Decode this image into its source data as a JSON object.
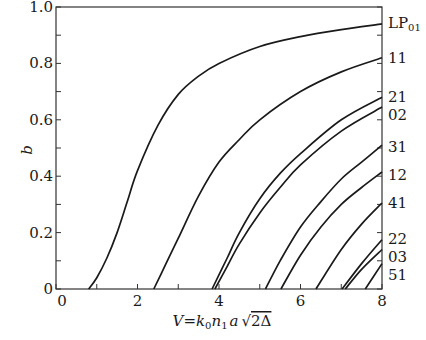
{
  "chart_data": {
    "type": "line",
    "title": "",
    "xlabel": "V = k0 n1 a √(2Δ)",
    "ylabel": "b",
    "xlim": [
      0,
      8
    ],
    "ylim": [
      0,
      1.0
    ],
    "grid": false,
    "legend_position": "right-edge inline labels",
    "x_ticks": [
      0,
      2,
      4,
      6,
      8
    ],
    "x_minor_ticks": [
      1,
      3,
      5,
      7
    ],
    "y_ticks": [
      0,
      0.2,
      0.4,
      0.6,
      0.8,
      1.0
    ],
    "y_tick_labels": [
      "0",
      "0.2",
      "0.4",
      "0.6",
      "0.8",
      "1.0"
    ],
    "y_minor_ticks": [
      0.1,
      0.3,
      0.5,
      0.7,
      0.9
    ],
    "series": [
      {
        "name": "LP01",
        "label": "LP",
        "label_sub": "01",
        "points": [
          [
            0.8,
            0
          ],
          [
            1.0,
            0.04
          ],
          [
            1.25,
            0.11
          ],
          [
            1.5,
            0.2
          ],
          [
            1.75,
            0.31
          ],
          [
            2,
            0.42
          ],
          [
            2.5,
            0.58
          ],
          [
            3,
            0.69
          ],
          [
            3.5,
            0.755
          ],
          [
            4,
            0.8
          ],
          [
            5,
            0.86
          ],
          [
            6,
            0.895
          ],
          [
            7,
            0.92
          ],
          [
            8,
            0.94
          ]
        ]
      },
      {
        "name": "11",
        "label": "11",
        "points": [
          [
            2.4,
            0
          ],
          [
            2.7,
            0.09
          ],
          [
            3,
            0.18
          ],
          [
            3.5,
            0.33
          ],
          [
            4,
            0.45
          ],
          [
            4.5,
            0.53
          ],
          [
            5,
            0.6
          ],
          [
            6,
            0.7
          ],
          [
            7,
            0.77
          ],
          [
            8,
            0.82
          ]
        ]
      },
      {
        "name": "21",
        "label": "21",
        "points": [
          [
            3.83,
            0
          ],
          [
            4.2,
            0.11
          ],
          [
            4.5,
            0.2
          ],
          [
            5,
            0.32
          ],
          [
            5.5,
            0.41
          ],
          [
            6,
            0.48
          ],
          [
            7,
            0.6
          ],
          [
            8,
            0.68
          ]
        ]
      },
      {
        "name": "02",
        "label": "02",
        "points": [
          [
            3.9,
            0
          ],
          [
            4.2,
            0.08
          ],
          [
            4.5,
            0.16
          ],
          [
            5,
            0.27
          ],
          [
            5.5,
            0.36
          ],
          [
            6,
            0.44
          ],
          [
            7,
            0.56
          ],
          [
            8,
            0.645
          ]
        ]
      },
      {
        "name": "31",
        "label": "31",
        "points": [
          [
            5.14,
            0
          ],
          [
            5.5,
            0.1
          ],
          [
            6,
            0.22
          ],
          [
            6.5,
            0.31
          ],
          [
            7,
            0.39
          ],
          [
            7.5,
            0.45
          ],
          [
            8,
            0.51
          ]
        ]
      },
      {
        "name": "12",
        "label": "12",
        "points": [
          [
            5.52,
            0
          ],
          [
            6,
            0.12
          ],
          [
            6.5,
            0.22
          ],
          [
            7,
            0.3
          ],
          [
            7.5,
            0.36
          ],
          [
            8,
            0.415
          ]
        ]
      },
      {
        "name": "41",
        "label": "41",
        "points": [
          [
            6.38,
            0
          ],
          [
            7,
            0.14
          ],
          [
            7.5,
            0.23
          ],
          [
            8,
            0.305
          ]
        ]
      },
      {
        "name": "22",
        "label": "22",
        "points": [
          [
            7.02,
            0
          ],
          [
            7.5,
            0.09
          ],
          [
            8,
            0.175
          ]
        ]
      },
      {
        "name": "03",
        "label": "03",
        "points": [
          [
            7.1,
            0
          ],
          [
            7.5,
            0.07
          ],
          [
            8,
            0.14
          ]
        ]
      },
      {
        "name": "51",
        "label": "51",
        "points": [
          [
            7.59,
            0
          ],
          [
            8,
            0.09
          ]
        ]
      }
    ]
  },
  "plot": {
    "left": 56,
    "right": 382,
    "top": 7,
    "bottom": 289,
    "line_color": "#1a1a1a",
    "axis_color": "#333333",
    "curve_width": 1.7
  },
  "labels": {
    "y_axis": "b",
    "x_axis_parts": {
      "V": "V",
      "eq": "=",
      "k": "k",
      "k_sub": "0",
      "n": "n",
      "n_sub": "1",
      "a": "a",
      "rad": "√",
      "two_delta": "2Δ"
    }
  }
}
